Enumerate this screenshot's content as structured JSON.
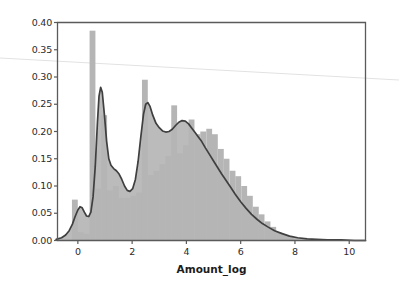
{
  "chart_data": {
    "type": "bar",
    "title": "",
    "xlabel": "Amount_log",
    "ylabel": "",
    "xlim": [
      -0.75,
      10.6
    ],
    "ylim": [
      0.0,
      0.4
    ],
    "xticks": [
      0,
      2,
      4,
      6,
      8,
      10
    ],
    "xtick_labels": [
      "0",
      "2",
      "4",
      "6",
      "8",
      "10"
    ],
    "yticks": [
      0.0,
      0.05,
      0.1,
      0.15,
      0.2,
      0.25,
      0.3,
      0.35,
      0.4
    ],
    "ytick_labels": [
      "0.00",
      "0.05",
      "0.10",
      "0.15",
      "0.20",
      "0.25",
      "0.30",
      "0.35",
      "0.40"
    ],
    "grid": false,
    "legend": "none",
    "colors": {
      "bar_fill": "#b5b5b5",
      "kde_line": "#3f3f3f",
      "kde_fill": "#b5b5b5",
      "axis": "#5a5a5a",
      "tick_text": "#2b2b2b",
      "background": "#ffffff",
      "artifact_line": "#e2e2e2"
    },
    "bar_width": 0.215,
    "categories": [
      "-0.11",
      "0.11",
      "0.32",
      "0.54",
      "0.75",
      "0.97",
      "1.18",
      "1.40",
      "1.61",
      "1.83",
      "2.04",
      "2.26",
      "2.47",
      "2.69",
      "2.90",
      "3.12",
      "3.33",
      "3.55",
      "3.76",
      "3.98",
      "4.19",
      "4.41",
      "4.62",
      "4.84",
      "5.05",
      "5.27",
      "5.48",
      "5.70",
      "5.91",
      "6.13",
      "6.34",
      "6.56",
      "6.77",
      "6.99",
      "7.20",
      "7.42",
      "7.63",
      "7.85"
    ],
    "values": [
      0.075,
      0.015,
      0.012,
      0.385,
      0.095,
      0.23,
      0.092,
      0.1,
      0.078,
      0.078,
      0.082,
      0.088,
      0.295,
      0.12,
      0.128,
      0.14,
      0.155,
      0.248,
      0.16,
      0.175,
      0.222,
      0.195,
      0.2,
      0.205,
      0.195,
      0.168,
      0.15,
      0.128,
      0.118,
      0.1,
      0.082,
      0.062,
      0.048,
      0.035,
      0.025,
      0.015,
      0.01,
      0.006
    ],
    "kde": {
      "x": [
        -0.8,
        -0.6,
        -0.45,
        -0.32,
        -0.2,
        -0.1,
        0.0,
        0.08,
        0.16,
        0.24,
        0.32,
        0.4,
        0.48,
        0.56,
        0.64,
        0.72,
        0.78,
        0.84,
        0.9,
        0.98,
        1.06,
        1.14,
        1.22,
        1.32,
        1.42,
        1.52,
        1.62,
        1.72,
        1.82,
        1.92,
        2.02,
        2.12,
        2.22,
        2.32,
        2.42,
        2.5,
        2.58,
        2.66,
        2.76,
        2.88,
        3.0,
        3.12,
        3.24,
        3.36,
        3.48,
        3.6,
        3.72,
        3.84,
        3.96,
        4.08,
        4.2,
        4.32,
        4.44,
        4.56,
        4.7,
        4.85,
        5.0,
        5.15,
        5.3,
        5.45,
        5.6,
        5.8,
        6.0,
        6.2,
        6.4,
        6.6,
        6.8,
        7.0,
        7.25,
        7.5,
        7.8,
        8.1,
        8.45,
        8.8,
        9.2,
        9.7,
        10.2,
        10.6
      ],
      "y": [
        0.002,
        0.005,
        0.01,
        0.018,
        0.03,
        0.044,
        0.056,
        0.062,
        0.06,
        0.052,
        0.045,
        0.044,
        0.052,
        0.08,
        0.135,
        0.215,
        0.265,
        0.281,
        0.272,
        0.23,
        0.182,
        0.15,
        0.138,
        0.132,
        0.128,
        0.122,
        0.112,
        0.1,
        0.092,
        0.09,
        0.095,
        0.112,
        0.145,
        0.19,
        0.232,
        0.25,
        0.253,
        0.246,
        0.23,
        0.215,
        0.207,
        0.201,
        0.199,
        0.2,
        0.204,
        0.211,
        0.217,
        0.22,
        0.219,
        0.214,
        0.206,
        0.198,
        0.19,
        0.182,
        0.17,
        0.158,
        0.146,
        0.134,
        0.122,
        0.111,
        0.1,
        0.085,
        0.071,
        0.059,
        0.048,
        0.039,
        0.031,
        0.025,
        0.018,
        0.013,
        0.008,
        0.005,
        0.003,
        0.002,
        0.001,
        0.001,
        0.0,
        0.0
      ]
    }
  }
}
